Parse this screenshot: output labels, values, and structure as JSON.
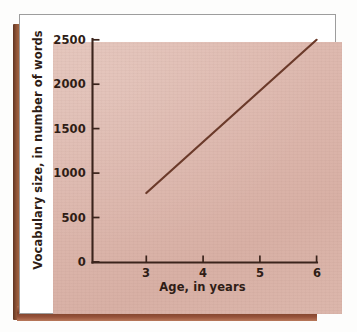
{
  "figure": {
    "panel_bg": "#ddb8ae",
    "frame_bg": "#ffffff",
    "frame_border": "#9d9d9d",
    "spine_color": "#7b4028"
  },
  "chart_data": {
    "type": "line",
    "title": "",
    "subtitle": "",
    "xlabel": "Age, in years",
    "ylabel": "Vocabulary size, in number of words",
    "xlim": [
      2.6,
      6
    ],
    "ylim": [
      0,
      2500
    ],
    "xticks": [
      3,
      4,
      5,
      6
    ],
    "xtick_labels": [
      "3",
      "4",
      "5",
      "6"
    ],
    "yticks": [
      0,
      500,
      1000,
      1500,
      2000,
      2500
    ],
    "ytick_labels": [
      "0",
      "500",
      "1000",
      "1500",
      "2000",
      "2500"
    ],
    "grid": false,
    "legend": false,
    "legend_position": "none",
    "series": [
      {
        "name": "Vocabulary size",
        "color": "#6b3a2a",
        "x": [
          3,
          6
        ],
        "values": [
          780,
          2500
        ],
        "points": [
          {
            "x": 3,
            "y": 780
          },
          {
            "x": 6,
            "y": 2500
          }
        ]
      }
    ]
  }
}
